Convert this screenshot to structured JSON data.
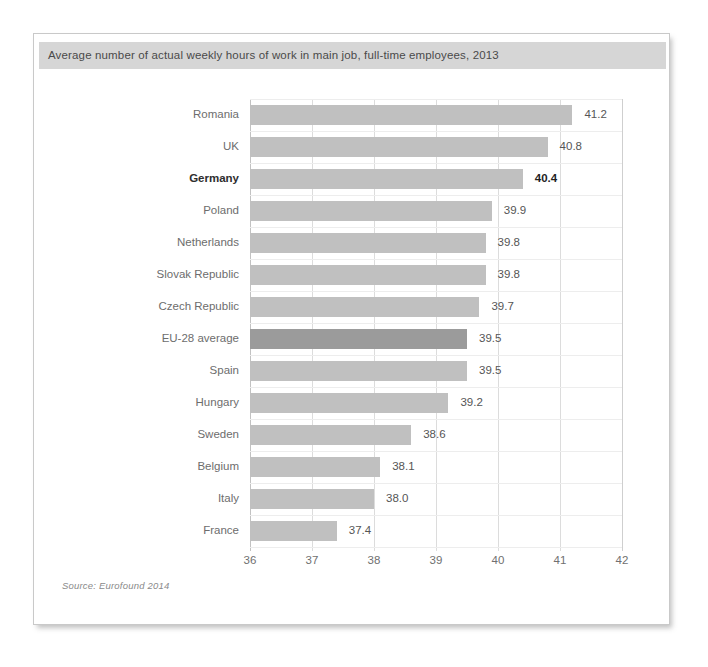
{
  "figure": {
    "title": "Average number of actual weekly hours of work in main job, full-time employees, 2013",
    "source_note": "Source: Eurofound 2014",
    "colors": {
      "title_band": "#d6d6d6",
      "bar": "#c0c0c0",
      "bar_highlight": "#9b9b9b",
      "grid": "#dcdcdc",
      "text": "#6d6d6d"
    }
  },
  "chart_data": {
    "type": "bar",
    "orientation": "horizontal",
    "title": "Average number of actual weekly hours of work in main job, full-time employees, 2013",
    "xlabel": "",
    "ylabel": "",
    "xlim": [
      36,
      42
    ],
    "xticks": [
      "36",
      "37",
      "38",
      "39",
      "40",
      "41",
      "42"
    ],
    "grid": true,
    "legend": "none",
    "source": "Source: Eurofound 2014",
    "categories": [
      "Romania",
      "UK",
      "Germany",
      "Poland",
      "Netherlands",
      "Slovak Republic",
      "Czech Republic",
      "EU-28 average",
      "Spain",
      "Hungary",
      "Sweden",
      "Belgium",
      "Italy",
      "France"
    ],
    "values": [
      41.2,
      40.8,
      40.4,
      39.9,
      39.8,
      39.8,
      39.7,
      39.5,
      39.5,
      39.2,
      38.6,
      38.1,
      38.0,
      37.4
    ],
    "value_labels": [
      "41.2",
      "40.8",
      "40.4",
      "39.9",
      "39.8",
      "39.8",
      "39.7",
      "39.5",
      "39.5",
      "39.2",
      "38.6",
      "38.1",
      "38.0",
      "37.4"
    ],
    "emphasis": {
      "bold_categories": [
        "Germany"
      ],
      "highlighted_bars": [
        "EU-28 average"
      ]
    }
  }
}
